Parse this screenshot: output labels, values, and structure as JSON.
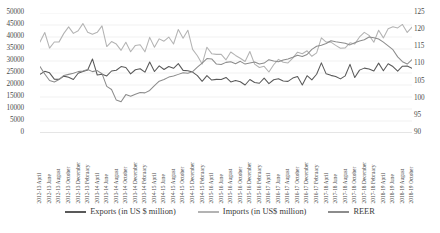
{
  "chart_data": {
    "type": "line",
    "title": "",
    "xlabel": "",
    "ylabel": "",
    "grid": true,
    "legend_position": "bottom",
    "axes": {
      "left": {
        "label": "in US $ million",
        "min": 0,
        "max": 50000,
        "step": 5000,
        "ticks": [
          "0",
          "5000",
          "10000",
          "15000",
          "20000",
          "25000",
          "30000",
          "35000",
          "40000",
          "45000",
          "50000"
        ]
      },
      "right": {
        "label": "REER index",
        "min": 90,
        "max": 125,
        "step": 5,
        "ticks": [
          "90",
          "95",
          "100",
          "105",
          "110",
          "115",
          "120",
          "125"
        ]
      }
    },
    "categories": [
      "2012-13 April",
      "2012-13 May",
      "2012-13 June",
      "2012-13 July",
      "2012-13 August",
      "2012-13 September",
      "2012-13 October",
      "2012-13 November",
      "2012-13 December",
      "2012-13 January",
      "2012-13 February",
      "2012-13 March",
      "2013-14 April",
      "2013-14 May",
      "2013-14 June",
      "2013-14 July",
      "2013-14 August",
      "2013-14 September",
      "2013-14 October",
      "2013-14 November",
      "2013-14 December",
      "2013-14 January",
      "2013-14 February",
      "2013-14 March",
      "2014-15 April",
      "2014-15 May",
      "2014-15 June",
      "2014-15 July",
      "2014-15 August",
      "2014-15 September",
      "2014-15 October",
      "2014-15 November",
      "2014-15 December",
      "2014-15 January",
      "2014-15 February",
      "2014-15 March",
      "2015-16 April",
      "2015-16 May",
      "2015-16 June",
      "2015-16 July",
      "2015-16 August",
      "2015-16 September",
      "2015-16 October",
      "2015-16 November",
      "2015-16 December",
      "2015-16 January",
      "2015-16 February",
      "2015-16 March",
      "2016-17 April",
      "2016-17 May",
      "2016-17 June",
      "2016-17 July",
      "2016-17 August",
      "2016-17 September",
      "2016-17 October",
      "2016-17 November",
      "2016-17 December",
      "2016-17 January",
      "2016-17 February",
      "2016-17 March",
      "2017-18 April",
      "2017-18 May",
      "2017-18 June",
      "2017-18 July",
      "2017-18 August",
      "2017-18 September",
      "2017-18 October",
      "2017-18 November",
      "2017-18 December",
      "2017-18 January",
      "2017-18 February",
      "2017-18 March",
      "2018-19 April",
      "2018-19 May",
      "2018-19 June",
      "2018-19 July",
      "2018-19 August",
      "2018-19 September",
      "2018-19 October"
    ],
    "tick_labels_shown": [
      "2012-13 April",
      "2012-13 June",
      "2012-13 August",
      "2012-13 October",
      "2012-13 December",
      "2012-13 February",
      "2013-14 April",
      "2013-14 June",
      "2013-14 August",
      "2013-14 October",
      "2013-14 December",
      "2013-14 February",
      "2014-15 April",
      "2014-15 June",
      "2014-15 August",
      "2014-15 October",
      "2014-15 December",
      "2014-15 February",
      "2015-16 April",
      "2015-16 June",
      "2015-16 August",
      "2015-16 October",
      "2015-16 December",
      "2015-16 February",
      "2016-17 April",
      "2016-17 June",
      "2016-17 August",
      "2016-17 October",
      "2016-17 December",
      "2016-17 February",
      "2017-18 April",
      "2017-18 June",
      "2017-18 August",
      "2017-18 October",
      "2017-18 December",
      "2017-18 February",
      "2018-19 April",
      "2018-19 June",
      "2018-19 August",
      "2018-19 October"
    ],
    "series": [
      {
        "name": "Exports (in US $ million)",
        "axis": "left",
        "color": "#595959",
        "values": [
          24448,
          25679,
          25068,
          22427,
          22346,
          23698,
          23246,
          22312,
          24884,
          25586,
          26261,
          30849,
          24164,
          24510,
          23775,
          25833,
          26139,
          27679,
          27271,
          24612,
          26353,
          26751,
          25345,
          29578,
          25634,
          27995,
          26475,
          27726,
          26957,
          28903,
          26093,
          25965,
          25397,
          23880,
          21543,
          23935,
          22051,
          22346,
          22283,
          23135,
          21267,
          21839,
          21351,
          20010,
          22286,
          21050,
          20725,
          22891,
          20566,
          22173,
          22571,
          21685,
          21516,
          22879,
          23511,
          20008,
          23880,
          22117,
          24491,
          29232,
          24638,
          24011,
          23562,
          22540,
          23826,
          28611,
          23098,
          26196,
          27030,
          26684,
          25834,
          29108,
          25914,
          28861,
          27702,
          25771,
          27842,
          27951,
          26980
        ]
      },
      {
        "name": "Imports (in US$ million)",
        "axis": "left",
        "color": "#b3b3b3",
        "values": [
          37904,
          41869,
          35379,
          37914,
          37965,
          41511,
          44209,
          41496,
          42589,
          45580,
          41983,
          41163,
          41949,
          44646,
          36035,
          38104,
          37052,
          34440,
          37826,
          33831,
          36486,
          36748,
          33819,
          39845,
          35722,
          39231,
          38245,
          39976,
          37079,
          43153,
          39451,
          42820,
          34836,
          32194,
          28730,
          35748,
          33050,
          32757,
          32776,
          30510,
          33742,
          32318,
          31124,
          29787,
          33962,
          28717,
          27280,
          27781,
          25408,
          28442,
          30677,
          29453,
          29193,
          31220,
          33670,
          33018,
          34254,
          31962,
          33389,
          39670,
          37881,
          37858,
          36518,
          35313,
          35463,
          37596,
          37116,
          40024,
          41914,
          40684,
          37815,
          42798,
          39628,
          43482,
          44301,
          43790,
          45239,
          41901,
          44111
        ]
      },
      {
        "name": "REER",
        "axis": "right",
        "color": "#8c8c8c",
        "values": [
          109.4,
          107.2,
          105.3,
          104.9,
          105.6,
          106.8,
          107.1,
          107.4,
          107.9,
          108.1,
          108.5,
          107.9,
          108.2,
          107.3,
          103.6,
          102.7,
          99.6,
          99.1,
          101.2,
          100.7,
          101.3,
          101.8,
          101.7,
          102.4,
          103.8,
          105.1,
          105.6,
          106.3,
          106.6,
          107.1,
          107.6,
          107.4,
          107.9,
          109.2,
          110.4,
          111.7,
          111.6,
          110.1,
          110.0,
          110.6,
          110.8,
          110.2,
          110.9,
          110.1,
          110.4,
          110.7,
          110.1,
          110.4,
          111.4,
          111.0,
          110.8,
          111.3,
          111.6,
          112.1,
          112.7,
          112.3,
          112.9,
          114.4,
          115.3,
          115.6,
          116.1,
          116.9,
          116.6,
          116.4,
          116.2,
          115.7,
          116.3,
          116.8,
          117.2,
          118.0,
          117.8,
          117.4,
          116.5,
          115.4,
          114.3,
          112.2,
          110.8,
          110.1,
          111.4
        ]
      }
    ]
  },
  "legend": {
    "items": [
      {
        "label": "Exports (in US $ million)",
        "color": "#595959"
      },
      {
        "label": "Imports (in US$ million)",
        "color": "#b3b3b3"
      },
      {
        "label": "REER",
        "color": "#8c8c8c"
      }
    ]
  }
}
